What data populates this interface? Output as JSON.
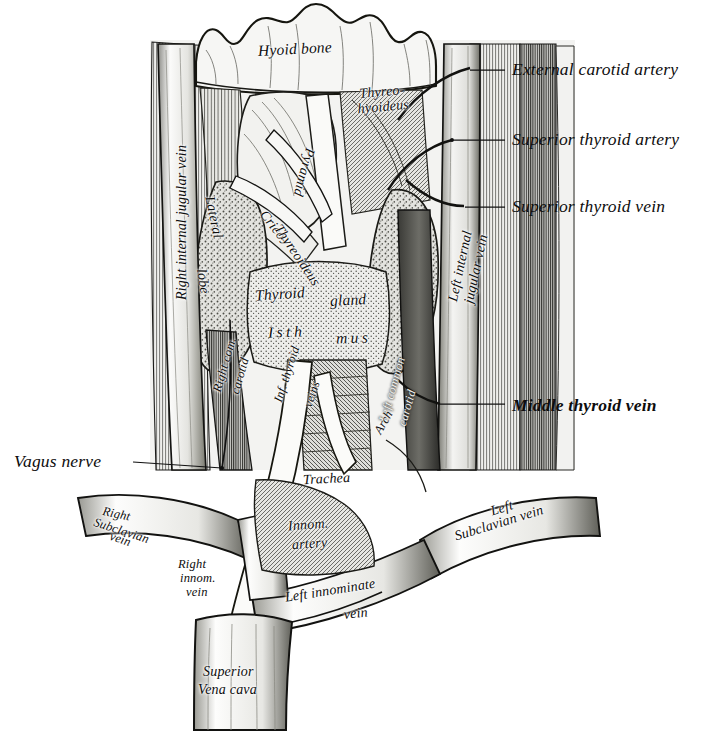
{
  "figure": {
    "style": "engraving",
    "ink": "#111111",
    "background": "#ffffff"
  },
  "callout_labels": [
    {
      "name": "external-carotid-artery",
      "text": "External carotid artery",
      "x": 512,
      "y": 60,
      "leader": {
        "x1": 470,
        "y1": 70,
        "x2": 505,
        "y2": 70
      }
    },
    {
      "name": "superior-thyroid-artery",
      "text": "Superior thyroid artery",
      "x": 512,
      "y": 130,
      "leader": {
        "x1": 452,
        "y1": 140,
        "x2": 505,
        "y2": 140
      }
    },
    {
      "name": "superior-thyroid-vein",
      "text": "Superior thyroid vein",
      "x": 512,
      "y": 197,
      "leader": {
        "x1": 465,
        "y1": 207,
        "x2": 505,
        "y2": 207
      }
    },
    {
      "name": "middle-thyroid-vein",
      "text": "Middle thyroid vein",
      "x": 512,
      "y": 396,
      "leader": {
        "x1": 440,
        "y1": 404,
        "x2": 505,
        "y2": 404
      }
    },
    {
      "name": "vagus-nerve",
      "text": "Vagus nerve",
      "x": 14,
      "y": 452,
      "leader": {
        "x1": 133,
        "y1": 462,
        "x2": 222,
        "y2": 468
      }
    }
  ],
  "inner_labels": [
    {
      "name": "hyoid-bone",
      "text": "Hyoid bone",
      "x": 258,
      "y": 41,
      "rotate": -3,
      "size": "inner-lg"
    },
    {
      "name": "thyreohyoideus",
      "text": "Thyreo-\nhyoideus",
      "x": 357,
      "y": 85,
      "rotate": -5,
      "size": "inner"
    },
    {
      "name": "pyramid",
      "text": "Pyramid",
      "x": 317,
      "y": 150,
      "rotate": 105,
      "size": "inner"
    },
    {
      "name": "lateral-lobe",
      "text": "Lateral",
      "x": 216,
      "y": 195,
      "rotate": 78,
      "size": "inner"
    },
    {
      "name": "lateral-lobe-second",
      "text": "lobe",
      "x": 208,
      "y": 268,
      "rotate": 82,
      "size": "inner"
    },
    {
      "name": "crico-thyreoideus",
      "text": "Crico-",
      "x": 268,
      "y": 208,
      "rotate": 52,
      "size": "inner"
    },
    {
      "name": "crico-thyreoideus-second",
      "text": "Thyreoideus",
      "x": 283,
      "y": 222,
      "rotate": 56,
      "size": "inner"
    },
    {
      "name": "thyroid-gland",
      "text": "Thyroid",
      "x": 255,
      "y": 286,
      "rotate": -4,
      "size": "inner-lg"
    },
    {
      "name": "thyroid-gland-second",
      "text": "gland",
      "x": 330,
      "y": 292,
      "rotate": -3,
      "size": "inner-lg"
    },
    {
      "name": "isthmus-left",
      "text": "Isth",
      "x": 268,
      "y": 324,
      "rotate": -2,
      "size": "inner-lg sp"
    },
    {
      "name": "isthmus-right",
      "text": "mus",
      "x": 336,
      "y": 330,
      "rotate": -2,
      "size": "inner-lg sp"
    },
    {
      "name": "right-internal-jugular-vein",
      "text": "Right internal jugular vein",
      "x": 175,
      "y": 300,
      "rotate": -90,
      "size": "inner"
    },
    {
      "name": "left-internal-jugular-vein",
      "text": "Left internal",
      "x": 446,
      "y": 300,
      "rotate": -78,
      "size": "inner"
    },
    {
      "name": "left-internal-jugular-vein-second",
      "text": "jugular vein",
      "x": 462,
      "y": 302,
      "rotate": -78,
      "size": "inner"
    },
    {
      "name": "right-common-carotid",
      "text": "Right com.",
      "x": 211,
      "y": 390,
      "rotate": -74,
      "size": "inner-sm"
    },
    {
      "name": "right-common-carotid-second",
      "text": "carotid",
      "x": 229,
      "y": 392,
      "rotate": -74,
      "size": "inner-sm"
    },
    {
      "name": "left-common-carotid",
      "text": "Left common",
      "x": 377,
      "y": 420,
      "rotate": -74,
      "size": "inner-sm"
    },
    {
      "name": "left-common-carotid-second",
      "text": "carotid",
      "x": 396,
      "y": 424,
      "rotate": -74,
      "size": "inner-sm"
    },
    {
      "name": "inferior-thyroid-veins",
      "text": "Inf. thyroid",
      "x": 272,
      "y": 400,
      "rotate": -72,
      "size": "inner-sm"
    },
    {
      "name": "inferior-thyroid-veins-second",
      "text": "veins",
      "x": 302,
      "y": 405,
      "rotate": -72,
      "size": "inner-sm"
    },
    {
      "name": "trachea",
      "text": "Trachea",
      "x": 303,
      "y": 472,
      "rotate": -3,
      "size": "inner"
    },
    {
      "name": "arch",
      "text": "Arch",
      "x": 372,
      "y": 430,
      "rotate": -60,
      "size": "inner-sm"
    },
    {
      "name": "innominate-artery",
      "text": "Innom.",
      "x": 288,
      "y": 518,
      "rotate": -4,
      "size": "inner"
    },
    {
      "name": "innominate-artery-second",
      "text": "artery",
      "x": 292,
      "y": 537,
      "rotate": -4,
      "size": "inner"
    },
    {
      "name": "right-subclavian-vein",
      "text": "Right",
      "x": 104,
      "y": 505,
      "rotate": 12,
      "size": "inner-sm"
    },
    {
      "name": "right-subclavian-vein-second",
      "text": "Subclavian",
      "x": 96,
      "y": 516,
      "rotate": 18,
      "size": "inner-sm"
    },
    {
      "name": "right-subclavian-vein-third",
      "text": "vein",
      "x": 112,
      "y": 530,
      "rotate": 18,
      "size": "inner-sm"
    },
    {
      "name": "right-innominate-vein",
      "text": "Right",
      "x": 178,
      "y": 558,
      "rotate": 0,
      "size": "inner-sm"
    },
    {
      "name": "right-innominate-vein-second",
      "text": "innom.",
      "x": 180,
      "y": 572,
      "rotate": 0,
      "size": "inner-sm"
    },
    {
      "name": "right-innominate-vein-third",
      "text": "vein",
      "x": 186,
      "y": 586,
      "rotate": 0,
      "size": "inner-sm"
    },
    {
      "name": "left-innominate-vein",
      "text": "Left innominate",
      "x": 284,
      "y": 591,
      "rotate": -9,
      "size": "inner"
    },
    {
      "name": "left-innominate-vein-second",
      "text": "vein",
      "x": 343,
      "y": 608,
      "rotate": -6,
      "size": "inner"
    },
    {
      "name": "left-subclavian-vein",
      "text": "Left",
      "x": 489,
      "y": 505,
      "rotate": -17,
      "size": "inner"
    },
    {
      "name": "left-subclavian-vein-second",
      "text": "Subclavian vein",
      "x": 453,
      "y": 530,
      "rotate": -17,
      "size": "inner"
    },
    {
      "name": "superior-vena-cava",
      "text": "Superior",
      "x": 203,
      "y": 665,
      "rotate": 0,
      "size": "inner"
    },
    {
      "name": "superior-vena-cava-second",
      "text": "Vena cava",
      "x": 198,
      "y": 683,
      "rotate": 0,
      "size": "inner"
    }
  ]
}
